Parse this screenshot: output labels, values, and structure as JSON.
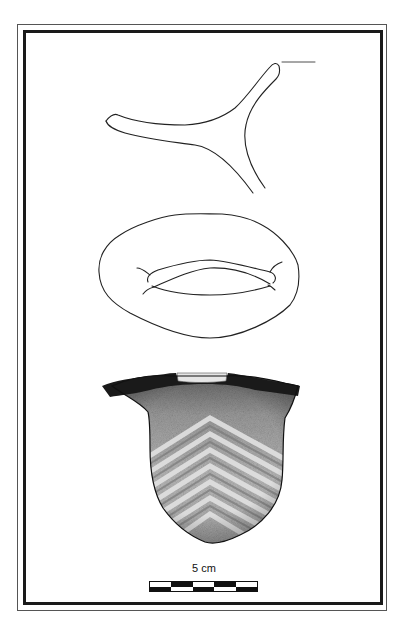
{
  "figure": {
    "views": [
      {
        "id": "top-view",
        "description": "three-armed rim/handle outline"
      },
      {
        "id": "plan-view",
        "description": "oval body with central slot opening"
      },
      {
        "id": "profile-view",
        "description": "shaded vessel with dark rim band and chevron pattern"
      }
    ],
    "scale_bar": {
      "label": "5 cm",
      "segments": 5,
      "top_row": [
        "white",
        "black",
        "white",
        "black",
        "white"
      ],
      "bottom_row": [
        "black",
        "white",
        "black",
        "white",
        "black"
      ]
    },
    "colors": {
      "line": "#222222",
      "rim_band": "#1a1a1a",
      "stipple_dark": "#6b6b6b",
      "stipple_light": "#d8d8d8",
      "frame": "#1a1a1a"
    }
  }
}
